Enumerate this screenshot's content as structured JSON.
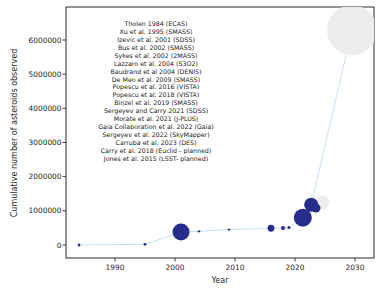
{
  "figure": {
    "width": 379,
    "height": 294,
    "background": "#ffffff"
  },
  "chart_data": {
    "type": "scatter",
    "title": "",
    "xlabel": "Year",
    "ylabel": "Cumulative number of asteroids observed",
    "xticks": [
      1990,
      2000,
      2010,
      2020,
      2030
    ],
    "yticks": [
      0,
      1000000,
      2000000,
      3000000,
      4000000,
      5000000,
      6000000
    ],
    "xlim": [
      1981.8,
      2033.2
    ],
    "ylim": [
      -250000,
      7000000
    ],
    "grid": false,
    "legend_position": "none",
    "colors": {
      "observed_marker": "#272d8a",
      "planned_marker": "#ececec",
      "connector_line": "#bcdcec",
      "axis": "#2a2a2a",
      "text": "#1f1f1f"
    },
    "citations": [
      "Tholen 1984 (ECAS)",
      "Xu et al. 1995 (SMASS)",
      "Izevic et al. 2001 (SDSS)",
      "Bus et al. 2002 (SMASS)",
      "Sykes et al. 2002 (2MASS)",
      "Lazzaro et al. 2004 (S3O2)",
      "Baudrand et al 2004 (DENIS)",
      "De Meo et al. 2009 (SMASS)",
      "Popescu et al. 2016 (VISTA)",
      "Popescu et al. 2018 (VISTA)",
      "Binzel et al. 2019 (SMASS)",
      "Sergeyev and Carry 2021 (SDSS)",
      "Morate et al. 2021 (J-PLUS)",
      "Gaia Collaboration et al. 2022 (Gaia)",
      "Sergeyev et al. 2022 (SkyMapper)",
      "Carruba et al. 2023 (DES)",
      "Carry et al. 2018 (Euclid - planned)",
      "Jones et al. 2015 (LSST- planned)"
    ],
    "points": [
      {
        "survey": "ECAS",
        "year": 1984,
        "cumulative": 0,
        "status": "observed",
        "radius": 1.4,
        "in_line": true,
        "label": "ECAS",
        "label_dx": 5,
        "label_dy": -10,
        "label_anchor": "middle",
        "label_font_size": 7.5
      },
      {
        "survey": "SMASS",
        "year": 1995,
        "cumulative": 20000,
        "status": "observed",
        "radius": 1.4,
        "in_line": true
      },
      {
        "survey": "SDSS",
        "year": 2001,
        "cumulative": 380000,
        "status": "observed",
        "radius": 8.5,
        "in_line": true,
        "label": "SDSS",
        "label_dx": -1,
        "label_dy": -14,
        "label_anchor": "middle",
        "label_font_size": 7.5
      },
      {
        "survey": "S3O2/DENIS",
        "year": 2004,
        "cumulative": 400000,
        "status": "observed",
        "radius": 1.2,
        "in_line": true
      },
      {
        "survey": "SMASS",
        "year": 2009,
        "cumulative": 450000,
        "status": "observed",
        "radius": 1.2,
        "in_line": true
      },
      {
        "survey": "VISTA",
        "year": 2016,
        "cumulative": 490000,
        "status": "observed",
        "radius": 3.4,
        "in_line": true
      },
      {
        "survey": "VISTA",
        "year": 2018,
        "cumulative": 500000,
        "status": "observed",
        "radius": 2.0,
        "in_line": true
      },
      {
        "survey": "SMASS",
        "year": 2019,
        "cumulative": 510000,
        "status": "observed",
        "radius": 1.5,
        "in_line": true
      },
      {
        "survey": "Euclid",
        "year": 2024.5,
        "cumulative": 1250000,
        "status": "planned",
        "radius": 7.0,
        "in_line": false,
        "label": "Euclid",
        "label_dx": -14,
        "label_dy": -8.5,
        "label_anchor": "middle",
        "label_font_size": 8
      },
      {
        "survey": "LSST",
        "year": 2029.5,
        "cumulative": 6290000,
        "status": "planned",
        "radius": 25,
        "in_line": true,
        "label": "LSST",
        "label_dx": -1,
        "label_dy": -8,
        "label_anchor": "middle",
        "label_font_size": 8.5
      },
      {
        "survey": "SDSS",
        "year": 2021.3,
        "cumulative": 800000,
        "status": "observed",
        "radius": 9.0,
        "in_line": true,
        "label": "SDSS",
        "label_dx": 12,
        "label_dy": 11.5,
        "label_anchor": "middle",
        "label_font_size": 7.5
      },
      {
        "survey": "Gaia",
        "year": 2022.7,
        "cumulative": 1180000,
        "status": "observed",
        "radius": 7.0,
        "in_line": true,
        "label": "Gaia",
        "label_dx": 11,
        "label_dy": 16.5,
        "label_anchor": "middle",
        "label_font_size": 7.5
      },
      {
        "survey": "SkyMapper",
        "year": 2023.5,
        "cumulative": 1080000,
        "status": "observed",
        "radius": 4.5,
        "in_line": false,
        "label": "SkyMapper",
        "label_dx": 3,
        "label_dy": 5,
        "label_anchor": "start",
        "label_font_size": 7.5
      }
    ],
    "pixel_mapping": {
      "x_at_1990": 115,
      "px_per_year": 6,
      "y_at_zero": 245,
      "px_per_million_y": 34.17
    },
    "plot_area": {
      "left": 66,
      "top": 7,
      "right": 374,
      "bottom": 258
    },
    "annotation_block": {
      "center_x": 156,
      "first_baseline_y": 26,
      "line_height": 7.93,
      "font_size": 6.3
    },
    "tick_font_size": 7.4,
    "axis_title_font_size": 8
  }
}
